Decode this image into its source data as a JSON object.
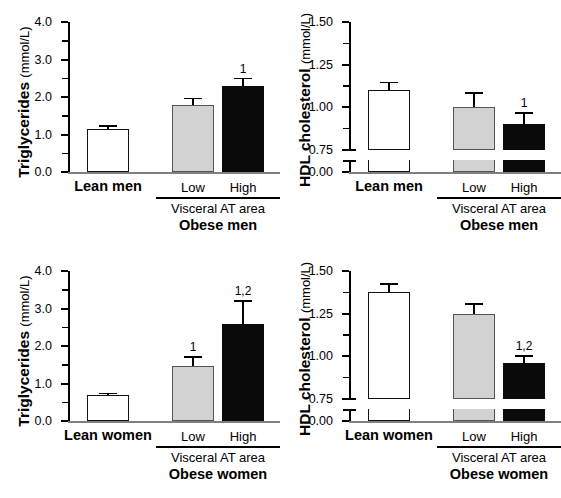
{
  "chart_data": [
    {
      "id": "triglycerides-men",
      "type": "bar",
      "title": "",
      "ylabel_bold": "Triglycerides",
      "ylabel_unit": "(mmol/L)",
      "ylim": [
        0.0,
        4.0
      ],
      "yticks": [
        "0.0",
        "1.0",
        "2.0",
        "3.0",
        "4.0"
      ],
      "ytick_values": [
        0.0,
        1.0,
        2.0,
        3.0,
        4.0
      ],
      "minor_tick_values": [
        0.5,
        1.5,
        2.5,
        3.5
      ],
      "axis_break": false,
      "grid": false,
      "categories": [
        "Lean men",
        "Low",
        "High"
      ],
      "values": [
        1.15,
        1.8,
        2.3
      ],
      "errors": [
        0.1,
        0.18,
        0.22
      ],
      "annotations": [
        "",
        "",
        "1"
      ],
      "fills": [
        "white",
        "gray",
        "black"
      ],
      "group_label": "Visceral AT area",
      "group_title": "Obese men",
      "lean_label": "Lean men"
    },
    {
      "id": "hdl-men",
      "type": "bar",
      "title": "",
      "ylabel_bold": "HDL cholesterol",
      "ylabel_unit": "(mmol/L)",
      "ylim": [
        0.75,
        1.5
      ],
      "yticks": [
        "0.00",
        "0.75",
        "1.00",
        "1.25",
        "1.50"
      ],
      "ytick_values": [
        0.0,
        0.75,
        1.0,
        1.25,
        1.5
      ],
      "minor_tick_values": [
        0.875,
        1.125,
        1.375
      ],
      "axis_break": true,
      "axis_break_at": 0.75,
      "grid": false,
      "categories": [
        "Lean men",
        "Low",
        "High"
      ],
      "values": [
        1.1,
        1.0,
        0.9
      ],
      "errors": [
        0.05,
        0.09,
        0.07
      ],
      "annotations": [
        "",
        "",
        "1"
      ],
      "fills": [
        "white",
        "gray",
        "black"
      ],
      "group_label": "Visceral AT area",
      "group_title": "Obese men",
      "lean_label": "Lean men"
    },
    {
      "id": "triglycerides-women",
      "type": "bar",
      "title": "",
      "ylabel_bold": "Triglycerides",
      "ylabel_unit": "(mmol/L)",
      "ylim": [
        0.0,
        4.0
      ],
      "yticks": [
        "0.0",
        "1.0",
        "2.0",
        "3.0",
        "4.0"
      ],
      "ytick_values": [
        0.0,
        1.0,
        2.0,
        3.0,
        4.0
      ],
      "minor_tick_values": [
        0.5,
        1.5,
        2.5,
        3.5
      ],
      "axis_break": false,
      "grid": false,
      "categories": [
        "Lean women",
        "Low",
        "High"
      ],
      "values": [
        0.7,
        1.47,
        2.6
      ],
      "errors": [
        0.06,
        0.26,
        0.62
      ],
      "annotations": [
        "",
        "1",
        "1,2"
      ],
      "fills": [
        "white",
        "gray",
        "black"
      ],
      "group_label": "Visceral AT area",
      "group_title": "Obese women",
      "lean_label": "Lean women"
    },
    {
      "id": "hdl-women",
      "type": "bar",
      "title": "",
      "ylabel_bold": "HDL cholesterol",
      "ylabel_unit": "(mmol/L)",
      "ylim": [
        0.75,
        1.5
      ],
      "yticks": [
        "0.00",
        "0.75",
        "1.00",
        "1.25",
        "1.50"
      ],
      "ytick_values": [
        0.0,
        0.75,
        1.0,
        1.25,
        1.5
      ],
      "minor_tick_values": [
        0.875,
        1.125,
        1.375
      ],
      "axis_break": true,
      "axis_break_at": 0.75,
      "grid": false,
      "categories": [
        "Lean women",
        "Low",
        "High"
      ],
      "values": [
        1.375,
        1.25,
        0.96
      ],
      "errors": [
        0.055,
        0.06,
        0.045
      ],
      "annotations": [
        "",
        "",
        "1,2"
      ],
      "fills": [
        "white",
        "gray",
        "black"
      ],
      "group_label": "Visceral AT area",
      "group_title": "Obese women",
      "lean_label": "Lean women"
    }
  ]
}
